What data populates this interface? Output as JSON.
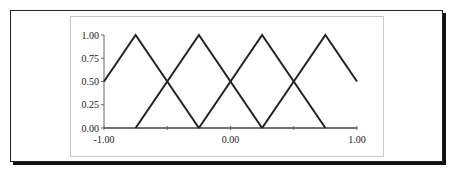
{
  "chart_data": {
    "type": "line",
    "title": "",
    "xlabel": "",
    "ylabel": "",
    "xlim": [
      -1.0,
      1.0
    ],
    "ylim": [
      0.0,
      1.0
    ],
    "grid": false,
    "legend": null,
    "x_ticks": [
      -1.0,
      -0.5,
      0.0,
      0.5,
      1.0
    ],
    "x_tick_labels": [
      "-1.00",
      "",
      "0.00",
      "",
      "1.00"
    ],
    "y_ticks": [
      0.0,
      0.25,
      0.5,
      0.75,
      1.0
    ],
    "y_tick_labels": [
      "0.00",
      "0.25",
      "0.50",
      "0.75",
      "1.00"
    ],
    "series": [
      {
        "name": "triangle-1",
        "x": [
          -1.0,
          -0.75,
          -0.25
        ],
        "y": [
          0.5,
          1.0,
          0.0
        ]
      },
      {
        "name": "triangle-2",
        "x": [
          -0.75,
          -0.25,
          0.25
        ],
        "y": [
          0.0,
          1.0,
          0.0
        ]
      },
      {
        "name": "triangle-3",
        "x": [
          -0.25,
          0.25,
          0.75
        ],
        "y": [
          0.0,
          1.0,
          0.0
        ]
      },
      {
        "name": "triangle-4",
        "x": [
          0.25,
          0.75,
          1.0
        ],
        "y": [
          0.0,
          1.0,
          0.5
        ]
      }
    ],
    "line_color": "#222222"
  }
}
